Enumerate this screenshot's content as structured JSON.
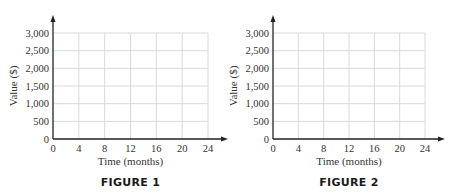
{
  "chart_data": [
    {
      "type": "line",
      "title": "",
      "caption": "FIGURE 1",
      "xlabel": "Time (months)",
      "ylabel": "Value ($)",
      "x_ticks": [
        0,
        4,
        8,
        12,
        16,
        20,
        24
      ],
      "x_tick_labels": [
        "0",
        "4",
        "8",
        "12",
        "16",
        "20",
        "24"
      ],
      "y_ticks": [
        0,
        500,
        1000,
        1500,
        2000,
        2500,
        3000
      ],
      "y_tick_labels": [
        "0",
        "500",
        "1,000",
        "1,500",
        "2,000",
        "2,500",
        "3,000"
      ],
      "xlim": [
        0,
        24
      ],
      "ylim": [
        0,
        3000
      ],
      "grid": true,
      "series": []
    },
    {
      "type": "line",
      "title": "",
      "caption": "FIGURE 2",
      "xlabel": "Time (months)",
      "ylabel": "Value ($)",
      "x_ticks": [
        0,
        4,
        8,
        12,
        16,
        20,
        24
      ],
      "x_tick_labels": [
        "0",
        "4",
        "8",
        "12",
        "16",
        "20",
        "24"
      ],
      "y_ticks": [
        0,
        500,
        1000,
        1500,
        2000,
        2500,
        3000
      ],
      "y_tick_labels": [
        "0",
        "500",
        "1,000",
        "1,500",
        "2,000",
        "2,500",
        "3,000"
      ],
      "xlim": [
        0,
        24
      ],
      "ylim": [
        0,
        3000
      ],
      "grid": true,
      "series": []
    }
  ],
  "colors": {
    "axis": "#222222",
    "grid": "#d9d9d9",
    "text": "#333333"
  }
}
